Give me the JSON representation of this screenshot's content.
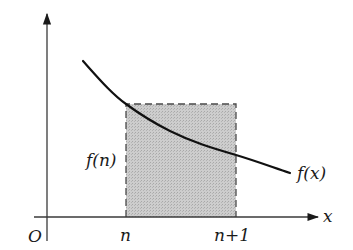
{
  "diagram": {
    "type": "integral-rectangle-comparison",
    "labels": {
      "origin": "O",
      "x_axis": "x",
      "n": "n",
      "n_plus_1": "n+1",
      "f_n": "f(n)",
      "f_x": "f(x)"
    },
    "colors": {
      "axis": "#3a3a3a",
      "curve": "#111111",
      "rect_fill": "#c9c9c9",
      "rect_border": "#4a4a4a",
      "text": "#1a1a1a"
    },
    "geometry": {
      "origin_px": [
        47,
        217
      ],
      "x_axis_end_px": [
        318,
        217
      ],
      "y_axis_top_px": [
        47,
        14
      ],
      "rect": {
        "x0": 126,
        "x1": 236,
        "y_top": 104,
        "y_bottom": 217
      },
      "curve_points_px": [
        [
          83,
          61
        ],
        [
          126,
          104
        ],
        [
          170,
          131
        ],
        [
          236,
          155
        ],
        [
          290,
          173
        ]
      ]
    }
  }
}
